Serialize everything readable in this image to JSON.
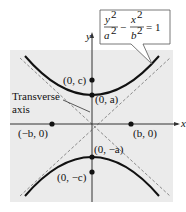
{
  "figure": {
    "type": "hyperbola-diagram",
    "equation": {
      "num1": "y",
      "den1": "a",
      "num2": "x",
      "den2": "b",
      "exp": "2",
      "minus": "−",
      "rhs": "= 1"
    },
    "axes": {
      "x_label": "x",
      "y_label": "y"
    },
    "points": {
      "vertex_top": "(0, a)",
      "focus_top": "(0, c)",
      "vertex_bottom": "(0, −a)",
      "focus_bottom": "(0, −c)",
      "co_vertex_left": "(−b, 0)",
      "co_vertex_right": "(b, 0)"
    },
    "annotation": {
      "line1": "Transverse",
      "line2": "axis"
    },
    "colors": {
      "background": "#ebebeb",
      "curve": "#111111",
      "asymptote": "#8a8a8a"
    }
  }
}
